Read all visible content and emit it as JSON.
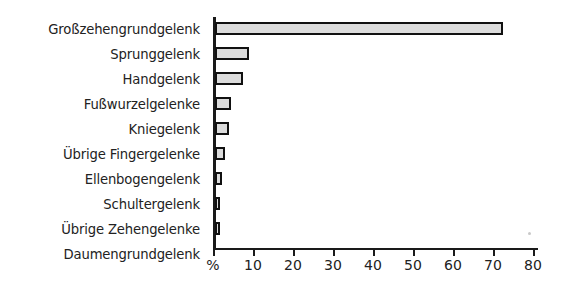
{
  "chart_data": {
    "type": "bar",
    "orientation": "horizontal",
    "title": "",
    "xlabel": "%",
    "ylabel": "",
    "xlim": [
      0,
      80
    ],
    "grid": false,
    "legend": null,
    "categories": [
      "Großzehengrundgelenk",
      "Sprunggelenk",
      "Handgelenk",
      "Fußwurzelgelenke",
      "Kniegelenk",
      "Übrige Fingergelenke",
      "Ellenbogengelenk",
      "Schultergelenk",
      "Übrige Zehengelenke",
      "Daumengrundgelenk"
    ],
    "values": [
      72,
      8.5,
      7,
      4,
      3.5,
      2.5,
      1.8,
      1.2,
      1.2,
      0
    ],
    "tick_values": [
      0,
      10,
      20,
      30,
      40,
      50,
      60,
      70,
      80
    ],
    "tick_labels": [
      "%",
      "10",
      "20",
      "30",
      "40",
      "50",
      "60",
      "70",
      "80"
    ],
    "bar_fill_color": "#dcdcdc",
    "bar_edge_color": "#111111",
    "axis_color": "#1a1a1a"
  }
}
